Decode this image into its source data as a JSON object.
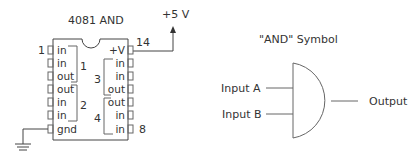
{
  "chip": {
    "title": "4081 AND",
    "power_label": "+5 V",
    "pin_first": "1",
    "pin_vcc": "14",
    "pin_last": "8",
    "left_pins": [
      "in",
      "in",
      "out",
      "out",
      "in",
      "in",
      "gnd"
    ],
    "right_pins": [
      "+V",
      "in",
      "in",
      "out",
      "out",
      "in",
      "in"
    ],
    "gate_numbers": [
      "1",
      "2",
      "3",
      "4"
    ]
  },
  "symbol": {
    "title": "\"AND\" Symbol",
    "input_a": "Input A",
    "input_b": "Input B",
    "output": "Output"
  },
  "colors": {
    "line": "#444444",
    "text": "#333333",
    "background": "#ffffff"
  }
}
